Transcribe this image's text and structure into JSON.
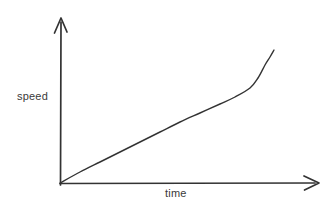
{
  "figure": {
    "type": "hand-drawn-line-graph",
    "background_color": "#ffffff",
    "ink_color": "#333333",
    "text_color": "#3a3a3a",
    "width": 335,
    "height": 217
  },
  "axes": {
    "y": {
      "label": "speed",
      "icon": "arrow-up-icon",
      "origin": {
        "x": 60,
        "y": 183
      },
      "tip": {
        "x": 61,
        "y": 18
      }
    },
    "x": {
      "label": "time",
      "icon": "arrow-right-icon",
      "origin": {
        "x": 60,
        "y": 183
      },
      "tip": {
        "x": 319,
        "y": 183
      }
    }
  },
  "chart_data": {
    "type": "line",
    "title": "",
    "xlabel": "time",
    "ylabel": "speed",
    "grid": false,
    "legend": null,
    "axis_ticks": {
      "x": [],
      "y": []
    },
    "xlim": [
      0,
      1
    ],
    "ylim": [
      0,
      1
    ],
    "series": [
      {
        "name": "speed vs time",
        "description": "Line rising from origin, nearly linear then curving steeply upward at the right end",
        "points_px": [
          {
            "x": 60,
            "y": 183
          },
          {
            "x": 80,
            "y": 172
          },
          {
            "x": 100,
            "y": 162
          },
          {
            "x": 120,
            "y": 152
          },
          {
            "x": 140,
            "y": 142
          },
          {
            "x": 160,
            "y": 132
          },
          {
            "x": 180,
            "y": 122
          },
          {
            "x": 200,
            "y": 113
          },
          {
            "x": 220,
            "y": 104
          },
          {
            "x": 235,
            "y": 97
          },
          {
            "x": 250,
            "y": 88
          },
          {
            "x": 258,
            "y": 78
          },
          {
            "x": 265,
            "y": 65
          },
          {
            "x": 270,
            "y": 57
          },
          {
            "x": 274,
            "y": 50
          }
        ],
        "x": [
          0.0,
          0.08,
          0.15,
          0.23,
          0.31,
          0.39,
          0.46,
          0.54,
          0.62,
          0.68,
          0.73,
          0.76,
          0.79,
          0.81,
          0.83
        ],
        "y": [
          0.0,
          0.07,
          0.13,
          0.19,
          0.25,
          0.31,
          0.37,
          0.42,
          0.48,
          0.52,
          0.58,
          0.64,
          0.72,
          0.76,
          0.81
        ]
      }
    ]
  }
}
